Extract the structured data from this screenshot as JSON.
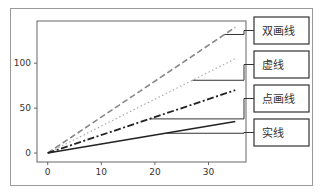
{
  "chart_data": {
    "type": "line",
    "title": "",
    "xlabel": "",
    "ylabel": "",
    "xlim": [
      -2,
      37
    ],
    "ylim": [
      -10,
      147
    ],
    "x_ticks": [
      0,
      10,
      20,
      30
    ],
    "y_ticks": [
      0,
      50,
      100
    ],
    "x_tick_labels": [
      "0",
      "10",
      "20",
      "30"
    ],
    "y_tick_labels": [
      "0",
      "50",
      "100"
    ],
    "grid": false,
    "legend": "none",
    "series": [
      {
        "name": "双画线",
        "style": "dashed",
        "color": "#888888",
        "x": [
          0,
          35
        ],
        "y": [
          0,
          140
        ]
      },
      {
        "name": "虚线",
        "style": "dotted",
        "color": "#aaaaaa",
        "x": [
          0,
          35
        ],
        "y": [
          0,
          105
        ]
      },
      {
        "name": "点画线",
        "style": "dashdot",
        "color": "#222222",
        "x": [
          0,
          35
        ],
        "y": [
          0,
          70
        ]
      },
      {
        "name": "实线",
        "style": "solid",
        "color": "#222222",
        "x": [
          0,
          35
        ],
        "y": [
          0,
          35
        ]
      }
    ],
    "annotations": [
      {
        "text": "双画线",
        "points_to_series": 0,
        "at_x": 33
      },
      {
        "text": "虚线",
        "points_to_series": 1,
        "at_x": 27
      },
      {
        "text": "点画线",
        "points_to_series": 2,
        "at_x": 19
      },
      {
        "text": "实线",
        "points_to_series": 3,
        "at_x": 22
      }
    ]
  }
}
